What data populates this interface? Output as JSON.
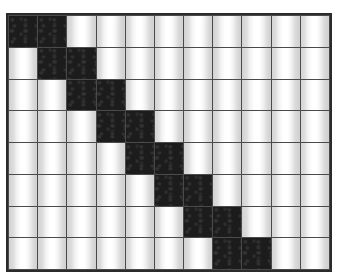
{
  "figure": {
    "type": "matrix-grid",
    "title": "",
    "rows": 8,
    "columns": 11,
    "filled_color": "#1c1c1c",
    "empty_color": "#ffffff",
    "gridline_color": "#4a4a4a",
    "border_color": "#2b2b2b",
    "pattern_name": "banded-diagonal",
    "filled_cells_per_row": 2,
    "matrix": [
      [
        1,
        1,
        0,
        0,
        0,
        0,
        0,
        0,
        0,
        0,
        0
      ],
      [
        0,
        1,
        1,
        0,
        0,
        0,
        0,
        0,
        0,
        0,
        0
      ],
      [
        0,
        0,
        1,
        1,
        0,
        0,
        0,
        0,
        0,
        0,
        0
      ],
      [
        0,
        0,
        0,
        1,
        1,
        0,
        0,
        0,
        0,
        0,
        0
      ],
      [
        0,
        0,
        0,
        0,
        1,
        1,
        0,
        0,
        0,
        0,
        0
      ],
      [
        0,
        0,
        0,
        0,
        0,
        1,
        1,
        0,
        0,
        0,
        0
      ],
      [
        0,
        0,
        0,
        0,
        0,
        0,
        1,
        1,
        0,
        0,
        0
      ],
      [
        0,
        0,
        0,
        0,
        0,
        0,
        0,
        1,
        1,
        0,
        0
      ]
    ],
    "row_labels": [
      "",
      "",
      "",
      "",
      "",
      "",
      "",
      ""
    ],
    "column_labels": [
      "",
      "",
      "",
      "",
      "",
      "",
      "",
      "",
      "",
      "",
      ""
    ]
  }
}
